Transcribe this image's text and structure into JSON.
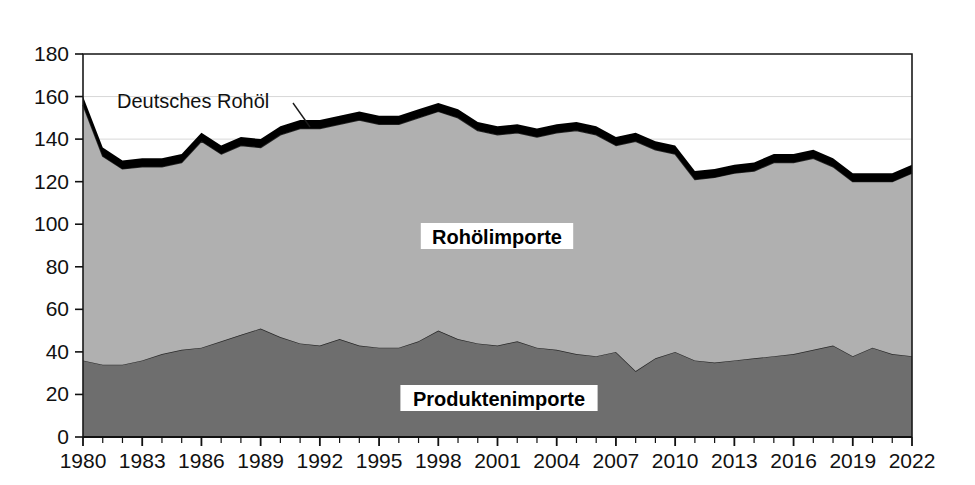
{
  "chart_data": {
    "type": "area",
    "title": "",
    "ylabel": "Millionen Tonnen",
    "xlabel": "",
    "ylim": [
      0,
      180
    ],
    "ytick_step": 20,
    "yticks": [
      "0",
      "20",
      "40",
      "60",
      "80",
      "100",
      "120",
      "140",
      "160",
      "180"
    ],
    "xlim": [
      1980,
      2022
    ],
    "xtick_step": 3,
    "xticks": [
      "1980",
      "1983",
      "1986",
      "1989",
      "1992",
      "1995",
      "1998",
      "2001",
      "2004",
      "2007",
      "2010",
      "2013",
      "2016",
      "2019",
      "2022"
    ],
    "grid": "horizontal-light",
    "legend_position": "inline-annotations",
    "stacked": true,
    "x": [
      1980,
      1981,
      1982,
      1983,
      1984,
      1985,
      1986,
      1987,
      1988,
      1989,
      1990,
      1991,
      1992,
      1993,
      1994,
      1995,
      1996,
      1997,
      1998,
      1999,
      2000,
      2001,
      2002,
      2003,
      2004,
      2005,
      2006,
      2007,
      2008,
      2009,
      2010,
      2011,
      2012,
      2013,
      2014,
      2015,
      2016,
      2017,
      2018,
      2019,
      2020,
      2021,
      2022
    ],
    "series": [
      {
        "name": "Produktenimporte",
        "color": "#6e6e6e",
        "values": [
          36,
          34,
          34,
          36,
          39,
          41,
          42,
          45,
          48,
          51,
          47,
          44,
          43,
          46,
          43,
          42,
          42,
          45,
          50,
          46,
          44,
          43,
          45,
          42,
          41,
          39,
          38,
          40,
          31,
          37,
          40,
          36,
          35,
          36,
          37,
          38,
          39,
          41,
          43,
          38,
          42,
          39,
          38
        ]
      },
      {
        "name": "Rohölimporte",
        "color": "#b0b0b0",
        "values": [
          120,
          98,
          92,
          91,
          88,
          88,
          97,
          88,
          89,
          85,
          95,
          101,
          102,
          101,
          106,
          105,
          105,
          105,
          103,
          104,
          100,
          99,
          98,
          99,
          102,
          105,
          104,
          97,
          108,
          98,
          93,
          85,
          87,
          88,
          88,
          91,
          90,
          90,
          84,
          82,
          78,
          81,
          86
        ]
      },
      {
        "name": "Deutsches Rohöl",
        "color": "#000000",
        "values": [
          4,
          4,
          4,
          4,
          4,
          4,
          4,
          4,
          4,
          4,
          4,
          4,
          4,
          4,
          4,
          4,
          4,
          4,
          4,
          4,
          4,
          4,
          4,
          4,
          4,
          4,
          4,
          4,
          4,
          4,
          4,
          4,
          4,
          4,
          4,
          4,
          4,
          4,
          4,
          4,
          4,
          4,
          4
        ]
      }
    ],
    "totals": [
      160,
      136,
      130,
      131,
      131,
      133,
      143,
      137,
      141,
      140,
      146,
      149,
      149,
      151,
      153,
      151,
      151,
      154,
      157,
      154,
      148,
      146,
      147,
      145,
      147,
      148,
      146,
      141,
      143,
      139,
      137,
      125,
      126,
      128,
      129,
      133,
      133,
      135,
      131,
      124,
      124,
      124,
      128
    ],
    "annotations": [
      {
        "text": "Deutsches Rohöl",
        "x": 1983,
        "y": 162
      }
    ]
  },
  "labels": {
    "axis_title": "Millionen Tonnen",
    "annotation_deutsches_rohoel": "Deutsches Rohöl",
    "series_rohoelimporte": "Rohölimporte",
    "series_produktenimporte": "Produktenimporte"
  },
  "colors": {
    "crude_imports": "#b0b0b0",
    "product_imports": "#6e6e6e",
    "german_crude": "#000000",
    "axis": "#1a1a1a",
    "gridline": "#d8d8d8",
    "text": "#111111",
    "background": "#ffffff"
  }
}
